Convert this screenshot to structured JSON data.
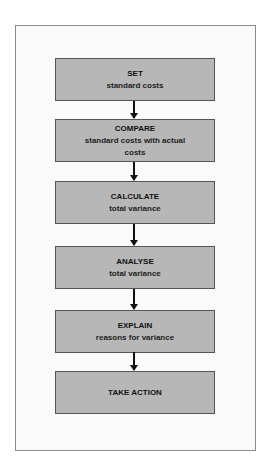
{
  "diagram": {
    "type": "flowchart",
    "steps": [
      {
        "title": "SET",
        "subtitle": "standard costs"
      },
      {
        "title": "COMPARE",
        "subtitle": "standard costs with actual costs"
      },
      {
        "title": "CALCULATE",
        "subtitle": "total variance"
      },
      {
        "title": "ANALYSE",
        "subtitle": "total variance"
      },
      {
        "title": "EXPLAIN",
        "subtitle": "reasons for variance"
      },
      {
        "title": "TAKE ACTION",
        "subtitle": ""
      }
    ],
    "colors": {
      "box_fill": "#b7b7b7",
      "box_border": "#555555",
      "arrow": "#111111",
      "frame_border": "#8a8a8a"
    }
  }
}
